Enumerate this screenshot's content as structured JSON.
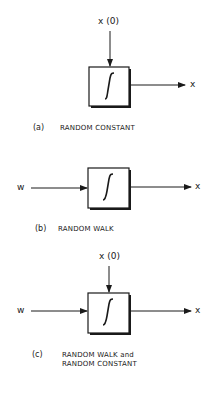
{
  "colors": {
    "ink": "#1a1a1a",
    "background": "#ffffff"
  },
  "diagrams": [
    {
      "id": "a",
      "initial_input_label": "x (0)",
      "block_symbol": "∫",
      "output_label": "x",
      "caption_id": "(a)",
      "caption_text": "RANDOM CONSTANT"
    },
    {
      "id": "b",
      "input_label": "w",
      "block_symbol": "∫",
      "output_label": "x",
      "caption_id": "(b)",
      "caption_text": "RANDOM WALK"
    },
    {
      "id": "c",
      "initial_input_label": "x (0)",
      "input_label": "w",
      "block_symbol": "∫",
      "output_label": "x",
      "caption_id": "(c)",
      "caption_text_line1": "RANDOM WALK and",
      "caption_text_line2": "RANDOM CONSTANT"
    }
  ]
}
